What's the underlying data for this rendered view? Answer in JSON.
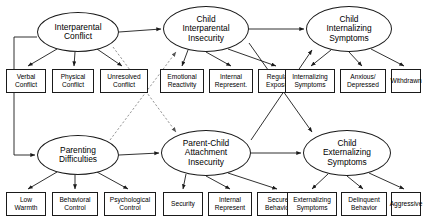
{
  "diagram": {
    "type": "structural-equation-model-path-diagram",
    "width": 424,
    "height": 222,
    "background_color": "#ffffff",
    "line_color": "#1a1a1a",
    "text_color": "#000000"
  },
  "latent_variables": [
    {
      "id": "interparental-conflict",
      "lines": [
        "Interparental",
        "Conflict"
      ],
      "x": 37,
      "y": 12,
      "w": 82,
      "h": 40
    },
    {
      "id": "child-interparental-insecurity",
      "lines": [
        "Child",
        "Interparental",
        "Insecurity"
      ],
      "x": 163,
      "y": 6,
      "w": 86,
      "h": 46
    },
    {
      "id": "child-internalizing-symptoms",
      "lines": [
        "Child",
        "Internalizing",
        "Symptoms"
      ],
      "x": 306,
      "y": 6,
      "w": 86,
      "h": 46
    },
    {
      "id": "parenting-difficulties",
      "lines": [
        "Parenting",
        "Difficulties"
      ],
      "x": 37,
      "y": 135,
      "w": 82,
      "h": 40
    },
    {
      "id": "parent-child-attachment-insecurity",
      "lines": [
        "Parent-Child",
        "Attachment",
        "Insecurity"
      ],
      "x": 161,
      "y": 130,
      "w": 90,
      "h": 46
    },
    {
      "id": "child-externalizing-symptoms",
      "lines": [
        "Child",
        "Externalizing",
        "Symptoms"
      ],
      "x": 303,
      "y": 130,
      "w": 88,
      "h": 46
    }
  ],
  "observed_variables": [
    {
      "id": "verbal-conflict",
      "lines": [
        "Verbal",
        "Conflict"
      ],
      "x": 6,
      "y": 69,
      "w": 40,
      "h": 24
    },
    {
      "id": "physical-conflict",
      "lines": [
        "Physical",
        "Conflict"
      ],
      "x": 52,
      "y": 69,
      "w": 42,
      "h": 24
    },
    {
      "id": "unresolved-conflict",
      "lines": [
        "Unresolved",
        "Conflict"
      ],
      "x": 100,
      "y": 69,
      "w": 48,
      "h": 24
    },
    {
      "id": "emotional-reactivity",
      "lines": [
        "Emotional",
        "Reactivity"
      ],
      "x": 160,
      "y": 69,
      "w": 44,
      "h": 24
    },
    {
      "id": "internal-represent-insecurity",
      "lines": [
        "Internal",
        "Represent."
      ],
      "x": 209,
      "y": 69,
      "w": 44,
      "h": 24
    },
    {
      "id": "regulate-exposure",
      "lines": [
        "Regulate",
        "Exposure"
      ],
      "x": 258,
      "y": 69,
      "w": 44,
      "h": 24
    },
    {
      "id": "internalizing-symptoms",
      "lines": [
        "Internalizing",
        "Symptoms"
      ],
      "x": 285,
      "y": 69,
      "w": 50,
      "h": 24
    },
    {
      "id": "anxious-depressed",
      "lines": [
        "Anxious/",
        "Depressed"
      ],
      "x": 340,
      "y": 69,
      "w": 46,
      "h": 24
    },
    {
      "id": "withdrawn",
      "lines": [
        "Withdrawn"
      ],
      "x": 391,
      "y": 69,
      "w": 30,
      "h": 24
    },
    {
      "id": "low-warmth",
      "lines": [
        "Low",
        "Warmth"
      ],
      "x": 6,
      "y": 192,
      "w": 40,
      "h": 24
    },
    {
      "id": "behavioral-control",
      "lines": [
        "Behavioral",
        "Control"
      ],
      "x": 52,
      "y": 192,
      "w": 46,
      "h": 24
    },
    {
      "id": "psychological-control",
      "lines": [
        "Psychological",
        "Control"
      ],
      "x": 104,
      "y": 192,
      "w": 52,
      "h": 24
    },
    {
      "id": "security",
      "lines": [
        "Security"
      ],
      "x": 163,
      "y": 192,
      "w": 40,
      "h": 24
    },
    {
      "id": "internal-represent-attachment",
      "lines": [
        "Internal",
        "Represent"
      ],
      "x": 208,
      "y": 192,
      "w": 44,
      "h": 24
    },
    {
      "id": "secure-behavior",
      "lines": [
        "Secure",
        "Behavior"
      ],
      "x": 257,
      "y": 192,
      "w": 42,
      "h": 24
    },
    {
      "id": "externalizing-symptoms",
      "lines": [
        "Externalizing",
        "Symptoms"
      ],
      "x": 287,
      "y": 192,
      "w": 50,
      "h": 24
    },
    {
      "id": "delinquent-behavior",
      "lines": [
        "Delinquent",
        "Behavior"
      ],
      "x": 341,
      "y": 192,
      "w": 46,
      "h": 24
    },
    {
      "id": "aggressive",
      "lines": [
        "Aggressive"
      ],
      "x": 391,
      "y": 192,
      "w": 30,
      "h": 24
    }
  ],
  "paths": {
    "structural_solid": [
      {
        "from": "interparental-conflict",
        "to": "child-interparental-insecurity"
      },
      {
        "from": "child-interparental-insecurity",
        "to": "child-internalizing-symptoms"
      },
      {
        "from": "parenting-difficulties",
        "to": "parent-child-attachment-insecurity"
      },
      {
        "from": "parent-child-attachment-insecurity",
        "to": "child-externalizing-symptoms"
      },
      {
        "from": "interparental-conflict",
        "to": "parenting-difficulties"
      },
      {
        "from": "child-interparental-insecurity",
        "to": "child-externalizing-symptoms"
      },
      {
        "from": "parent-child-attachment-insecurity",
        "to": "child-internalizing-symptoms"
      }
    ],
    "structural_dashed": [
      {
        "from": "interparental-conflict",
        "to": "parent-child-attachment-insecurity"
      },
      {
        "from": "parenting-difficulties",
        "to": "child-interparental-insecurity"
      }
    ],
    "measurement": [
      {
        "from": "interparental-conflict",
        "to": "verbal-conflict"
      },
      {
        "from": "interparental-conflict",
        "to": "physical-conflict"
      },
      {
        "from": "interparental-conflict",
        "to": "unresolved-conflict"
      },
      {
        "from": "child-interparental-insecurity",
        "to": "emotional-reactivity"
      },
      {
        "from": "child-interparental-insecurity",
        "to": "internal-represent-insecurity"
      },
      {
        "from": "child-interparental-insecurity",
        "to": "regulate-exposure"
      },
      {
        "from": "child-internalizing-symptoms",
        "to": "internalizing-symptoms"
      },
      {
        "from": "child-internalizing-symptoms",
        "to": "anxious-depressed"
      },
      {
        "from": "child-internalizing-symptoms",
        "to": "withdrawn"
      },
      {
        "from": "parenting-difficulties",
        "to": "low-warmth"
      },
      {
        "from": "parenting-difficulties",
        "to": "behavioral-control"
      },
      {
        "from": "parenting-difficulties",
        "to": "psychological-control"
      },
      {
        "from": "parent-child-attachment-insecurity",
        "to": "security"
      },
      {
        "from": "parent-child-attachment-insecurity",
        "to": "internal-represent-attachment"
      },
      {
        "from": "parent-child-attachment-insecurity",
        "to": "secure-behavior"
      },
      {
        "from": "child-externalizing-symptoms",
        "to": "externalizing-symptoms"
      },
      {
        "from": "child-externalizing-symptoms",
        "to": "delinquent-behavior"
      },
      {
        "from": "child-externalizing-symptoms",
        "to": "aggressive"
      }
    ]
  }
}
